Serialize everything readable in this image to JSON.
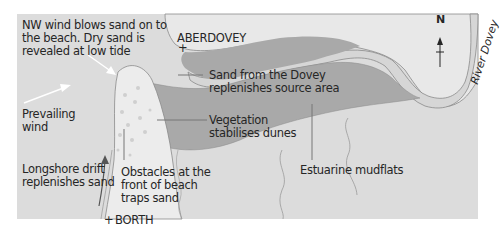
{
  "diagram": {
    "colors": {
      "sea_background": "#dcdcdc",
      "land_light": "#e8e8e8",
      "sand_channel": "#d6d6d6",
      "dune_dark": "#a9a9a9",
      "beach_spit": "#ececec",
      "outline": "#8a8a8a",
      "text": "#262626",
      "leader_line": "#777777",
      "wind_arrow": "#ffffff"
    },
    "places": {
      "aberdovey": "ABERDOVEY",
      "borth": "BORTH",
      "place_marker": "+"
    },
    "river_label": "River Dovey",
    "north_label": "N",
    "labels": {
      "nw_wind": [
        "NW wind blows sand on to",
        "the beach. Dry sand is",
        "revealed at low tide"
      ],
      "prevailing_wind": [
        "Prevailing",
        "wind"
      ],
      "longshore_drift": [
        "Longshore drift",
        "replenishes sand"
      ],
      "obstacles": [
        "Obstacles at the",
        "front of beach",
        "traps sand"
      ],
      "sand_from_dovey": [
        "Sand from the Dovey",
        "replenishes source area"
      ],
      "vegetation": [
        "Vegetation",
        "stabilises dunes"
      ],
      "mudflats": [
        "Estuarine mudflats"
      ]
    }
  }
}
